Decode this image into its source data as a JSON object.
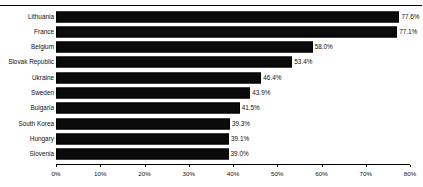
{
  "chart_data": {
    "type": "bar",
    "orientation": "horizontal",
    "title": "Installed electricity generation capacity from renewable energy generation",
    "xlabel": "",
    "ylabel": "",
    "categories": [
      "Lithuania",
      "France",
      "Belgium",
      "Slovak Republic",
      "Ukraine",
      "Sweden",
      "Bulgaria",
      "South Korea",
      "Hungary",
      "Slovenia"
    ],
    "values": [
      77.6,
      77.1,
      58.0,
      53.4,
      46.4,
      43.9,
      41.5,
      39.3,
      39.1,
      39.0
    ],
    "value_labels": [
      "77.6%",
      "77.1%",
      "58.0%",
      "53.4%",
      "46.4%",
      "43.9%",
      "41.5%",
      "39.3%",
      "39.1%",
      "39.0%"
    ],
    "xlim": [
      0,
      80
    ],
    "xticks": [
      0,
      10,
      20,
      30,
      40,
      50,
      60,
      70,
      80
    ],
    "xtick_labels": [
      "0%",
      "10%",
      "20%",
      "30%",
      "40%",
      "50%",
      "60%",
      "70%",
      "80%"
    ],
    "grid": false,
    "legend": false,
    "bar_color": "#0a0a0a",
    "text_color": "#111111",
    "background_color": "#ffffff"
  }
}
